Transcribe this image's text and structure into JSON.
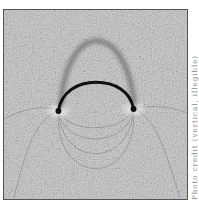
{
  "figure": {
    "colors": {
      "background": "#b8b8b8",
      "filings": "#3a3a3a",
      "magnet": "#111111",
      "pole_halo": "#e8e8e8"
    }
  },
  "caption": {
    "text": "Photo credit (vertical, illegible)"
  }
}
